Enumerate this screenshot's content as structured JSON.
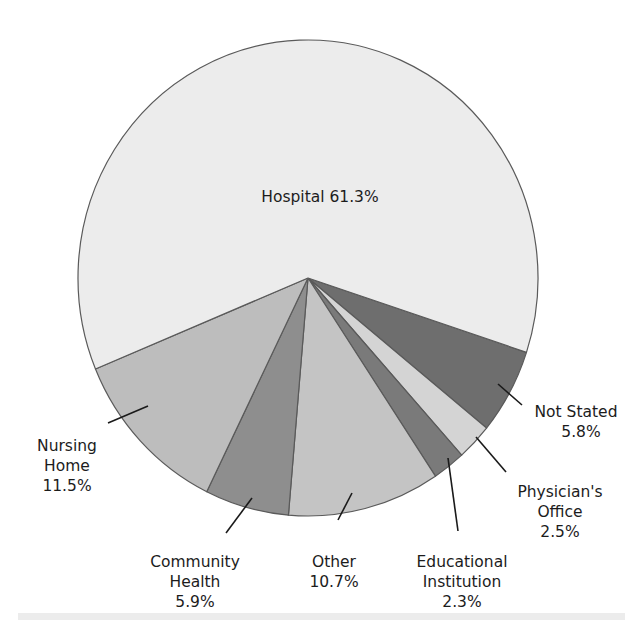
{
  "chart_data": {
    "type": "pie",
    "title": "",
    "start_angle_deg": 18.2,
    "direction": "clockwise",
    "center": [
      308,
      278
    ],
    "radius": [
      230,
      238
    ],
    "slices": [
      {
        "name": "Not Stated",
        "value": 5.8,
        "color": "#6e6e6e",
        "label_lines": [
          "Not Stated",
          "5.8%"
        ]
      },
      {
        "name": "Physician's Office",
        "value": 2.5,
        "color": "#d4d4d4",
        "label_lines": [
          "Physician's",
          "Office",
          "2.5%"
        ]
      },
      {
        "name": "Educational Institution",
        "value": 2.3,
        "color": "#7a7a7a",
        "label_lines": [
          "Educational",
          "Institution",
          "2.3%"
        ]
      },
      {
        "name": "Other",
        "value": 10.7,
        "color": "#c4c4c4",
        "label_lines": [
          "Other",
          "10.7%"
        ]
      },
      {
        "name": "Community Health",
        "value": 5.9,
        "color": "#8e8e8e",
        "label_lines": [
          "Community",
          "Health",
          "5.9%"
        ]
      },
      {
        "name": "Nursing Home",
        "value": 11.5,
        "color": "#bdbdbd",
        "label_lines": [
          "Nursing",
          "Home",
          "11.5%"
        ]
      },
      {
        "name": "Hospital",
        "value": 61.3,
        "color": "#ececec",
        "label_lines": [
          "Hospital 61.3%"
        ]
      }
    ],
    "legend": null,
    "annotations": []
  },
  "labels": {
    "hospital": {
      "text": "Hospital 61.3%"
    },
    "not_stated": {
      "line1": "Not Stated",
      "line2": "5.8%"
    },
    "physicians_office": {
      "line1": "Physician's",
      "line2": "Office",
      "line3": "2.5%"
    },
    "educational": {
      "line1": "Educational",
      "line2": "Institution",
      "line3": "2.3%"
    },
    "other": {
      "line1": "Other",
      "line2": "10.7%"
    },
    "community": {
      "line1": "Community",
      "line2": "Health",
      "line3": "5.9%"
    },
    "nursing": {
      "line1": "Nursing",
      "line2": "Home",
      "line3": "11.5%"
    }
  }
}
